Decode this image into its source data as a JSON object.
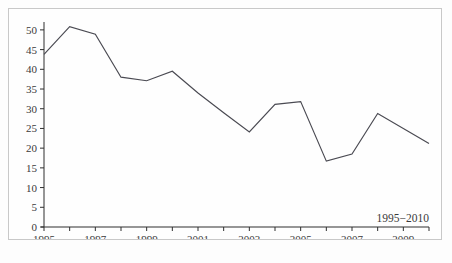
{
  "chart_data": {
    "type": "line",
    "title": "",
    "subtitle": "",
    "xlabel": "",
    "ylabel": "",
    "annotation": "1995−2010",
    "grid": false,
    "legend_position": "none",
    "x": [
      1995,
      1996,
      1997,
      1998,
      1999,
      2000,
      2001,
      2002,
      2003,
      2004,
      2005,
      2006,
      2007,
      2008,
      2009,
      2010
    ],
    "categories": [
      "1995",
      "1996",
      "1997",
      "1998",
      "1999",
      "2000",
      "2001",
      "2002",
      "2003",
      "2004",
      "2005",
      "2006",
      "2007",
      "2008",
      "2009",
      "2010"
    ],
    "values": [
      43.8,
      50.8,
      48.9,
      38.0,
      37.1,
      39.5,
      34.0,
      29.0,
      24.1,
      31.1,
      31.8,
      16.7,
      18.5,
      28.8,
      25.0,
      21.2
    ],
    "series": [
      {
        "name": "",
        "values": [
          43.8,
          50.8,
          48.9,
          38.0,
          37.1,
          39.5,
          34.0,
          29.0,
          24.1,
          31.1,
          31.8,
          16.7,
          18.5,
          28.8,
          25.0,
          21.2
        ]
      }
    ],
    "xlim": [
      1995,
      2010
    ],
    "ylim": [
      0,
      52
    ],
    "ytick_values": [
      0,
      5,
      10,
      15,
      20,
      25,
      30,
      35,
      40,
      45,
      50
    ],
    "ytick_labels": [
      "0",
      "5",
      "10",
      "15",
      "20",
      "25",
      "30",
      "35",
      "40",
      "45",
      "50"
    ],
    "xtick_values": [
      1995,
      1996,
      1997,
      1998,
      1999,
      2000,
      2001,
      2002,
      2003,
      2004,
      2005,
      2006,
      2007,
      2008,
      2009,
      2010
    ],
    "xtick_labels": [
      "1995",
      "",
      "1997",
      "",
      "1999",
      "",
      "2001",
      "",
      "2003",
      "",
      "2005",
      "",
      "2007",
      "",
      "2009",
      ""
    ],
    "line_color": "#4a4a52",
    "axis_color": "#2e2e2e",
    "text_color": "#3a3a3a",
    "frame_color": "#c8c8c8",
    "background_color": "#fefefe"
  }
}
